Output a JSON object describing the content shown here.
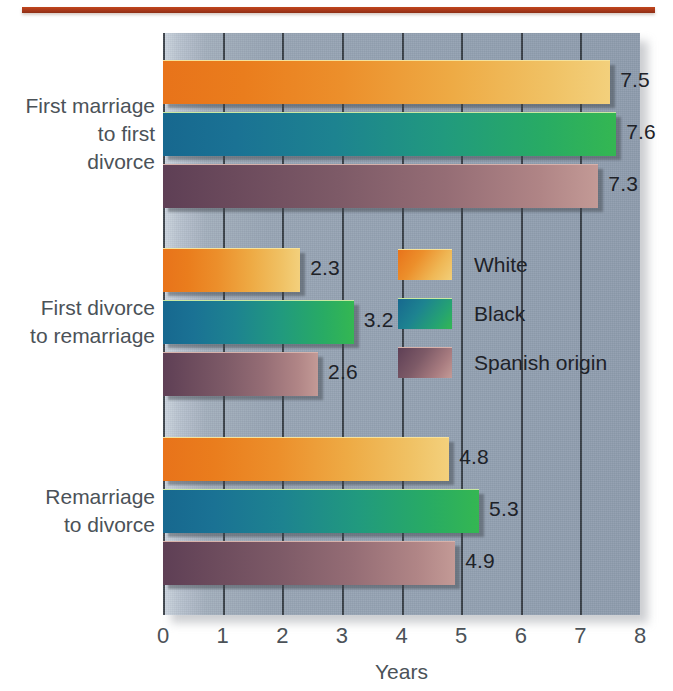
{
  "decor": {
    "top_rule_color": "#a8381a"
  },
  "chart_data": {
    "type": "bar",
    "orientation": "horizontal",
    "title": "",
    "xlabel": "Years",
    "ylabel": "",
    "xlim": [
      0,
      8
    ],
    "xticks": [
      "0",
      "1",
      "2",
      "3",
      "4",
      "5",
      "6",
      "7",
      "8"
    ],
    "grid": true,
    "legend_position": "center-right inside plot",
    "categories": [
      "First marriage\nto first\ndivorce",
      "First divorce\nto remarriage",
      "Remarriage\nto divorce"
    ],
    "series": [
      {
        "name": "White",
        "color": "#ec8f2b",
        "values": [
          7.5,
          2.3,
          4.8
        ]
      },
      {
        "name": "Black",
        "color": "#1d8390",
        "values": [
          7.6,
          3.2,
          5.3
        ]
      },
      {
        "name": "Spanish origin",
        "color": "#7d5a67",
        "values": [
          7.3,
          2.6,
          4.9
        ]
      }
    ],
    "data_labels": [
      [
        "7.5",
        "7.6",
        "7.3"
      ],
      [
        "2.3",
        "3.2",
        "2.6"
      ],
      [
        "4.8",
        "5.3",
        "4.9"
      ]
    ]
  },
  "legend": {
    "items": [
      {
        "label": "White"
      },
      {
        "label": "Black"
      },
      {
        "label": "Spanish origin"
      }
    ]
  },
  "axis": {
    "title": "Years",
    "ticks": [
      "0",
      "1",
      "2",
      "3",
      "4",
      "5",
      "6",
      "7",
      "8"
    ]
  }
}
